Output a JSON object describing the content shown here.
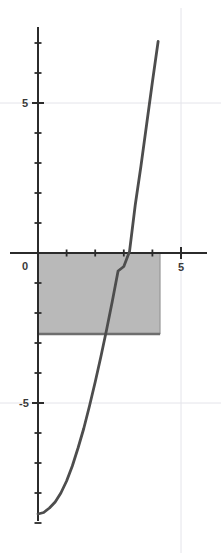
{
  "chart_data": {
    "type": "line",
    "title": "",
    "xlabel": "",
    "ylabel": "",
    "xlim": [
      -0.3,
      5.6
    ],
    "ylim": [
      -9.5,
      7.8
    ],
    "grid": true,
    "legend": null,
    "x_tick_labels": [
      "0",
      "5"
    ],
    "x_tick_values": [
      0,
      5
    ],
    "y_tick_labels": [
      "5",
      "-5"
    ],
    "y_tick_values": [
      5,
      -5
    ],
    "x_minor_ticks": [
      1,
      2,
      3,
      4
    ],
    "y_minor_ticks": [
      7,
      6,
      4,
      3,
      2,
      1,
      -1,
      -2,
      -3,
      -4,
      -6,
      -7,
      -8,
      -9
    ],
    "gridlines_x": [
      5
    ],
    "gridlines_y": [
      5,
      -5
    ],
    "series": [
      {
        "name": "curve",
        "color": "#4d4d4d",
        "x": [
          0.0,
          0.2,
          0.4,
          0.6,
          0.8,
          1.0,
          1.2,
          1.4,
          1.6,
          1.8,
          2.0,
          2.2,
          2.4,
          2.6,
          2.8,
          3.0,
          3.2,
          3.4,
          3.6,
          3.8,
          4.0,
          4.2
        ],
        "y": [
          -8.7,
          -8.65,
          -8.5,
          -8.3,
          -8.0,
          -7.6,
          -7.1,
          -6.5,
          -5.85,
          -5.1,
          -4.3,
          -3.45,
          -2.55,
          -1.6,
          -0.6,
          -0.45,
          0.05,
          1.6,
          2.9,
          4.3,
          5.7,
          7.05
        ]
      }
    ],
    "shaded_region": {
      "name": "riemann-rectangle",
      "fill_color": "#b5b5b5",
      "edge_color": "#6e6e6e",
      "x_start": 0,
      "x_end": 4.27,
      "y_top": 0,
      "y_bottom": -2.7
    },
    "axis_color": "#2b2b2b",
    "grid_color": "#e4e4ea",
    "background": "#ffffff"
  },
  "labels": {
    "x_zero": "0",
    "x_five": "5",
    "y_five": "5",
    "y_minus_five": "-5"
  }
}
